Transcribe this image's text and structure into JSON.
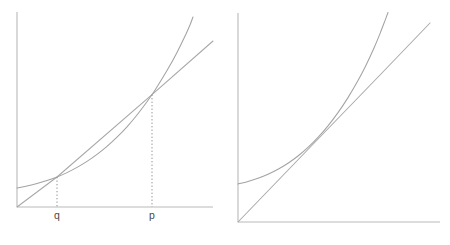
{
  "figure": {
    "title": "",
    "panel_count": 2,
    "background_color": "#ffffff",
    "curve_color": "#a3a3a3",
    "line_color": "#a8a8a8",
    "axis_color": "#b9b9b9",
    "dotted_color": "#8f8f8f",
    "label_color": "#4a4a4a"
  },
  "chart_data": [
    {
      "type": "line",
      "panel": "left",
      "title": "",
      "xlabel": "",
      "ylabel": "",
      "grid": false,
      "legend": null,
      "axes": {
        "y_axis": {
          "x": 17,
          "y_top": 12,
          "y_bottom": 207
        },
        "x_axis": {
          "y": 207,
          "x_left": 17,
          "x_right": 213
        },
        "xlim": [
          17,
          213
        ],
        "ylim": [
          207,
          12
        ]
      },
      "series": [
        {
          "name": "convex-curve",
          "role": "function",
          "points": [
            [
              17,
              188.0
            ],
            [
              27,
              186.0
            ],
            [
              37,
              183.6
            ],
            [
              47,
              180.6
            ],
            [
              57,
              177.0
            ],
            [
              67,
              172.6
            ],
            [
              77,
              167.4
            ],
            [
              87,
              161.4
            ],
            [
              97,
              154.4
            ],
            [
              107,
              146.4
            ],
            [
              117,
              137.2
            ],
            [
              127,
              126.8
            ],
            [
              137,
              115.0
            ],
            [
              147,
              101.8
            ],
            [
              152,
              94.6
            ],
            [
              157,
              87.0
            ],
            [
              167,
              70.6
            ],
            [
              177,
              52.4
            ],
            [
              186,
              34.0
            ],
            [
              190,
              25.0
            ],
            [
              193,
              17.0
            ]
          ]
        },
        {
          "name": "secant-line",
          "role": "chord",
          "points": [
            [
              17,
              207.0
            ],
            [
              57,
              177.0
            ],
            [
              152,
              94.6
            ],
            [
              213,
              41.0
            ]
          ]
        }
      ],
      "drop_lines": [
        {
          "name": "q-drop",
          "x": 57,
          "y_from": 177.0,
          "y_to": 207
        },
        {
          "name": "p-drop",
          "x": 152,
          "y_from": 94.6,
          "y_to": 207
        }
      ],
      "tick_labels": [
        {
          "text": "q",
          "x": 57,
          "y": 211
        },
        {
          "text": "p",
          "x": 152,
          "y": 211
        }
      ],
      "annotations": []
    },
    {
      "type": "line",
      "panel": "right",
      "title": "",
      "xlabel": "",
      "ylabel": "",
      "grid": false,
      "legend": null,
      "axes": {
        "y_axis": {
          "x": 238,
          "y_top": 13,
          "y_bottom": 222
        },
        "x_axis": {
          "y": 222,
          "x_left": 238,
          "x_right": 440
        },
        "xlim": [
          238,
          440
        ],
        "ylim": [
          222,
          13
        ]
      },
      "series": [
        {
          "name": "convex-curve",
          "role": "function",
          "points": [
            [
              238,
              184.0
            ],
            [
              248,
              181.4
            ],
            [
              258,
              178.2
            ],
            [
              268,
              174.2
            ],
            [
              278,
              169.2
            ],
            [
              288,
              163.2
            ],
            [
              298,
              156.0
            ],
            [
              308,
              147.4
            ],
            [
              318,
              137.4
            ],
            [
              328,
              125.8
            ],
            [
              338,
              112.6
            ],
            [
              348,
              97.6
            ],
            [
              358,
              80.6
            ],
            [
              366,
              65.2
            ],
            [
              374,
              48.0
            ],
            [
              380,
              33.6
            ],
            [
              385,
              20.6
            ],
            [
              388,
              12.5
            ]
          ]
        },
        {
          "name": "tangent-line",
          "role": "tangent",
          "points": [
            [
              238,
              222.0
            ],
            [
              320,
              137.0
            ],
            [
              380,
              75.0
            ],
            [
              430,
              23.0
            ]
          ]
        }
      ],
      "drop_lines": [],
      "tick_labels": [],
      "annotations": []
    }
  ],
  "labels": {
    "left_panel": {
      "q_label": "q",
      "p_label": "p"
    },
    "right_panel": {}
  }
}
